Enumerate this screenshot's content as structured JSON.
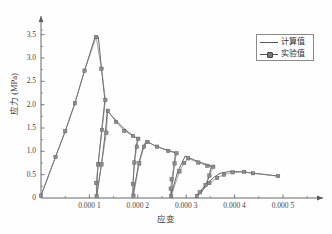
{
  "chart_data": {
    "type": "line",
    "title": "",
    "xlabel": "应变",
    "ylabel": "应力 (MPa)",
    "xlim": [
      0,
      0.00056
    ],
    "ylim": [
      0,
      3.75
    ],
    "grid": false,
    "legend_position": "top-right",
    "x_ticks": [
      {
        "value": 0.0001,
        "label": "0.000 1"
      },
      {
        "value": 0.0002,
        "label": "0.000 2"
      },
      {
        "value": 0.0003,
        "label": "0.000 3"
      },
      {
        "value": 0.0004,
        "label": "0.000 4"
      },
      {
        "value": 0.0005,
        "label": "0.000 5"
      }
    ],
    "y_ticks": [
      {
        "value": 0,
        "label": "0"
      },
      {
        "value": 0.5,
        "label": "0.5"
      },
      {
        "value": 1.0,
        "label": "1.0"
      },
      {
        "value": 1.5,
        "label": "1.5"
      },
      {
        "value": 2.0,
        "label": "2.0"
      },
      {
        "value": 2.5,
        "label": "2.5"
      },
      {
        "value": 3.0,
        "label": "3.0"
      },
      {
        "value": 3.5,
        "label": "3.5"
      }
    ],
    "y_minor_ticks": [
      0.25,
      0.75,
      1.25,
      1.75,
      2.25,
      2.75,
      3.25,
      3.6
    ],
    "x_minor_ticks": [
      5e-05,
      0.00015,
      0.00025,
      0.00035,
      0.00045,
      0.00055
    ],
    "legend": [
      {
        "name": "计算值",
        "marker": "none",
        "line": "solid",
        "color": "#555555"
      },
      {
        "name": "实验值",
        "marker": "square",
        "line": "solid",
        "color": "#7a7a7a"
      }
    ],
    "series": [
      {
        "name": "计算值",
        "marker": "none",
        "color": "#4a4a4a",
        "points": [
          [
            0.0,
            0.05
          ],
          [
            3e-05,
            0.88
          ],
          [
            5e-05,
            1.43
          ],
          [
            7e-05,
            2.03
          ],
          [
            9e-05,
            2.73
          ],
          [
            0.000112,
            3.46
          ],
          [
            0.0001185,
            3.45
          ],
          [
            0.000125,
            2.77
          ],
          [
            0.000132,
            2.1
          ],
          [
            0.000125,
            1.4
          ],
          [
            0.000118,
            0.72
          ],
          [
            0.000115,
            0.23
          ],
          [
            0.000115,
            0.04
          ],
          [
            0.000125,
            0.72
          ],
          [
            0.000133,
            1.41
          ],
          [
            0.000137,
            1.86
          ],
          [
            0.00015,
            1.72
          ],
          [
            0.00017,
            1.5
          ],
          [
            0.00019,
            1.33
          ],
          [
            0.0002,
            1.27
          ],
          [
            0.000196,
            1.07
          ],
          [
            0.000193,
            0.76
          ],
          [
            0.00019,
            0.3
          ],
          [
            0.00019,
            0.05
          ],
          [
            0.000202,
            0.75
          ],
          [
            0.000212,
            1.12
          ],
          [
            0.000218,
            1.22
          ],
          [
            0.000235,
            1.12
          ],
          [
            0.00026,
            1.03
          ],
          [
            0.000278,
            0.97
          ],
          [
            0.000276,
            0.77
          ],
          [
            0.000272,
            0.4
          ],
          [
            0.00027,
            0.2
          ],
          [
            0.000268,
            0.04
          ],
          [
            0.000282,
            0.55
          ],
          [
            0.000292,
            0.77
          ],
          [
            0.000298,
            0.9
          ],
          [
            0.00032,
            0.8
          ],
          [
            0.000342,
            0.72
          ],
          [
            0.000352,
            0.68
          ],
          [
            0.000348,
            0.5
          ],
          [
            0.000342,
            0.3
          ],
          [
            0.000332,
            0.12
          ],
          [
            0.00032,
            0.04
          ],
          [
            0.000342,
            0.3
          ],
          [
            0.000358,
            0.45
          ],
          [
            0.00037,
            0.53
          ],
          [
            0.00039,
            0.57
          ],
          [
            0.000415,
            0.56
          ],
          [
            0.000433,
            0.54
          ],
          [
            0.00049,
            0.47
          ]
        ]
      },
      {
        "name": "实验值",
        "marker": "square",
        "color": "#7c7c7c",
        "points": [
          [
            0.0,
            0.05
          ],
          [
            3e-05,
            0.88
          ],
          [
            5e-05,
            1.43
          ],
          [
            7e-05,
            2.03
          ],
          [
            9e-05,
            2.73
          ],
          [
            0.000114,
            3.45
          ],
          [
            0.000125,
            2.77
          ],
          [
            0.000133,
            2.1
          ],
          [
            0.000126,
            1.46
          ],
          [
            0.000118,
            0.72
          ],
          [
            0.000114,
            0.32
          ],
          [
            0.000115,
            0.04
          ],
          [
            0.000125,
            0.72
          ],
          [
            0.000135,
            1.4
          ],
          [
            0.000138,
            1.87
          ],
          [
            0.000155,
            1.63
          ],
          [
            0.000172,
            1.44
          ],
          [
            0.00019,
            1.33
          ],
          [
            0.000201,
            1.27
          ],
          [
            0.000198,
            1.1
          ],
          [
            0.000193,
            0.76
          ],
          [
            0.00019,
            0.3
          ],
          [
            0.000191,
            0.05
          ],
          [
            0.000203,
            0.74
          ],
          [
            0.000213,
            1.1
          ],
          [
            0.00022,
            1.2
          ],
          [
            0.00024,
            1.1
          ],
          [
            0.000263,
            1.01
          ],
          [
            0.00028,
            0.96
          ],
          [
            0.000276,
            0.74
          ],
          [
            0.00027,
            0.4
          ],
          [
            0.000268,
            0.2
          ],
          [
            0.000269,
            0.04
          ],
          [
            0.000286,
            0.57
          ],
          [
            0.000296,
            0.75
          ],
          [
            0.000304,
            0.85
          ],
          [
            0.000325,
            0.76
          ],
          [
            0.000344,
            0.69
          ],
          [
            0.000356,
            0.67
          ],
          [
            0.000348,
            0.48
          ],
          [
            0.00034,
            0.28
          ],
          [
            0.000328,
            0.12
          ],
          [
            0.000322,
            0.04
          ],
          [
            0.000348,
            0.32
          ],
          [
            0.000364,
            0.43
          ],
          [
            0.000378,
            0.5
          ],
          [
            0.000396,
            0.55
          ],
          [
            0.00042,
            0.56
          ],
          [
            0.000438,
            0.53
          ],
          [
            0.00049,
            0.47
          ]
        ]
      }
    ]
  },
  "axes": {
    "x_arrow": true,
    "y_arrow": true,
    "origin_label": "0"
  }
}
